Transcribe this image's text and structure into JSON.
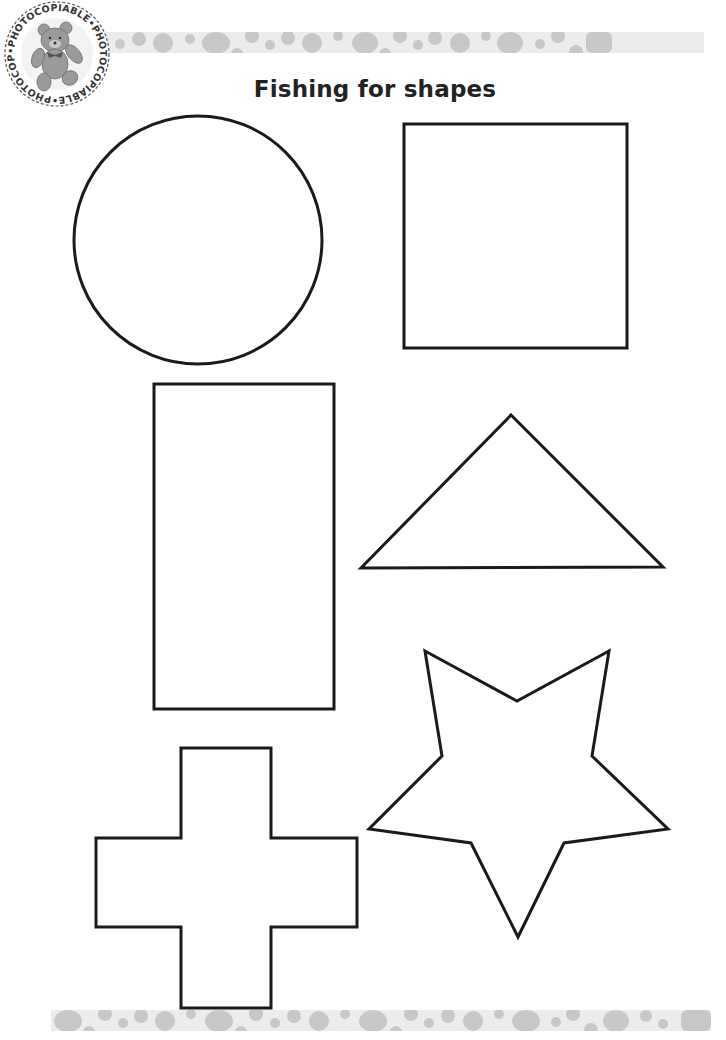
{
  "page": {
    "title": "Fishing for shapes",
    "badge": {
      "text": "PHOTOCOPIABLE",
      "ring_text": "•PHOTOCOPIABLE•PHOTOCOPIABLE•PHOTOCOPIABLE",
      "image": "teddy-bear"
    },
    "colors": {
      "background": "#ffffff",
      "outline": "#1a1a1a",
      "band_base": "#ececec",
      "band_dots": "#c8c8c8",
      "title": "#222222"
    }
  },
  "shapes": [
    {
      "name": "circle",
      "label": "Circle"
    },
    {
      "name": "square",
      "label": "Square"
    },
    {
      "name": "rectangle",
      "label": "Rectangle"
    },
    {
      "name": "triangle",
      "label": "Triangle"
    },
    {
      "name": "star",
      "label": "Star"
    },
    {
      "name": "cross",
      "label": "Cross"
    }
  ]
}
